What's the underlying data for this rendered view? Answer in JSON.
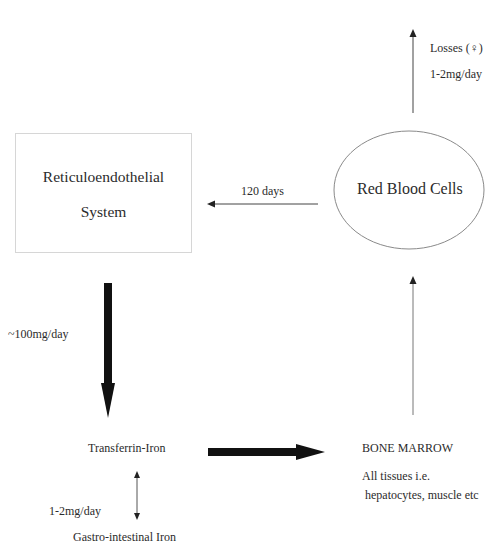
{
  "diagram": {
    "nodes": {
      "reticuloendothelial": {
        "line1": "Reticuloendothelial",
        "line2": "System"
      },
      "red_blood_cells": {
        "label": "Red Blood Cells"
      },
      "transferrin": {
        "label": "Transferrin-Iron"
      },
      "bone_marrow": {
        "label": "BONE MARROW",
        "sub1": "All tissues i.e.",
        "sub2": "hepatocytes, muscle etc"
      },
      "gi_iron": {
        "label": "Gastro-intestinal Iron"
      }
    },
    "edges": {
      "rbc_to_re": {
        "label": "120 days"
      },
      "losses": {
        "label": "Losses (♀)",
        "rate": "1-2mg/day"
      },
      "re_to_transferrin": {
        "label": "~100mg/day"
      },
      "gi_exchange": {
        "label": "1-2mg/day"
      },
      "transferrin_to_marrow": {
        "label": ""
      },
      "marrow_to_rbc": {
        "label": ""
      }
    },
    "colors": {
      "stroke": "#2a2a2a",
      "thin_arrow": "#555555",
      "box_border": "#d6d6d6",
      "ellipse_border": "#8a8a8a"
    }
  }
}
